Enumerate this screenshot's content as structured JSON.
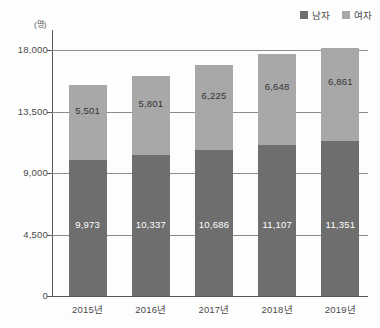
{
  "chart_data": {
    "type": "bar",
    "subtype": "stacked-vertical",
    "title": "",
    "subtitle": "",
    "xlabel": "",
    "ylabel": "",
    "unit_label": "(명)",
    "categories": [
      "2015년",
      "2016년",
      "2017년",
      "2018년",
      "2019년"
    ],
    "series": [
      {
        "name": "남자",
        "color": "#6e6e6e",
        "values": [
          9973,
          10337,
          10686,
          11107,
          11351
        ],
        "labels": [
          "9,973",
          "10,337",
          "10,686",
          "11,107",
          "11,351"
        ],
        "label_color": "#ffffff"
      },
      {
        "name": "여자",
        "color": "#a8a8a8",
        "values": [
          5501,
          5801,
          6225,
          6648,
          6861
        ],
        "labels": [
          "5,501",
          "5,801",
          "6,225",
          "6,648",
          "6,861"
        ],
        "label_color": "#333333"
      }
    ],
    "totals": [
      15474,
      16138,
      16911,
      17755,
      18212
    ],
    "ylim": [
      0,
      19500
    ],
    "yticks": [
      0,
      4500,
      9000,
      13500,
      18000
    ],
    "ytick_labels": [
      "0",
      "4,500",
      "9,000",
      "13,500",
      "18,000"
    ],
    "grid": true,
    "grid_axis": "y",
    "legend_position": "top-right",
    "stacked": true
  },
  "legend": {
    "entries": [
      {
        "label": "남자",
        "color": "#6e6e6e"
      },
      {
        "label": "여자",
        "color": "#a8a8a8"
      }
    ]
  }
}
